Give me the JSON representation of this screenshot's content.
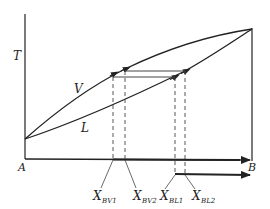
{
  "diagram": {
    "type": "binary-phase-diagram",
    "axis_labels": {
      "y": "T",
      "left": "A",
      "right": "B"
    },
    "curves": {
      "vapor": "V",
      "liquid": "L"
    },
    "compositions": [
      {
        "main": "X",
        "sub": "BV1"
      },
      {
        "main": "X",
        "sub": "BV2"
      },
      {
        "main": "X",
        "sub": "BL1"
      },
      {
        "main": "X",
        "sub": "BL2"
      }
    ],
    "colors": {
      "line": "#222222",
      "dashed": "#444444",
      "background": "#ffffff"
    }
  }
}
